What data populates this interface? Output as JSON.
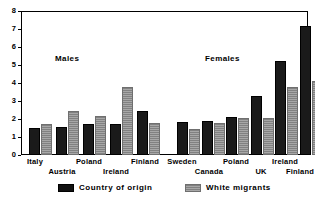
{
  "chart_data": {
    "type": "bar",
    "title": "",
    "subtitle": "",
    "xlabel": "",
    "ylabel": "",
    "ylim": [
      0,
      8
    ],
    "yticks": [
      0,
      1,
      2,
      3,
      4,
      5,
      6,
      7,
      8
    ],
    "ytick_labels": [
      "0",
      "1",
      "2",
      "3",
      "4",
      "5",
      "6",
      "7",
      "8"
    ],
    "grid": false,
    "legend_position": "bottom",
    "legend": [
      "Country of origin",
      "White migrants"
    ],
    "series": [
      {
        "name": "Country of origin",
        "color": "#111111",
        "values": [
          1.5,
          1.55,
          1.7,
          1.75,
          2.45,
          1.85,
          1.9,
          2.1,
          3.3,
          5.2,
          7.15
        ]
      },
      {
        "name": "White migrants",
        "color": "#9d9d9d",
        "values": [
          1.75,
          2.45,
          2.15,
          3.8,
          1.8,
          1.45,
          1.8,
          2.05,
          2.05,
          3.8,
          4.1
        ]
      }
    ],
    "categories": [
      "Italy",
      "Austria",
      "Poland",
      "Ireland",
      "Finland",
      "Sweden",
      "Canada",
      "Poland",
      "UK",
      "Ireland",
      "Finland"
    ],
    "panels": [
      {
        "label": "Males",
        "categories": [
          "Italy",
          "Austria",
          "Poland",
          "Ireland",
          "Finland"
        ]
      },
      {
        "label": "Females",
        "categories": [
          "Sweden",
          "Canada",
          "Poland",
          "UK",
          "Ireland",
          "Finland"
        ]
      }
    ],
    "annotations": [
      {
        "text": "Males",
        "x": 55,
        "y": 60
      },
      {
        "text": "Females",
        "x": 207,
        "y": 60
      }
    ]
  },
  "axis": {
    "y_labels": [
      "8",
      "7",
      "6",
      "5",
      "4",
      "3",
      "2",
      "1",
      "0"
    ]
  },
  "panel_labels": {
    "males": "Males",
    "females": "Females"
  },
  "x_axis_labels": [
    {
      "text": "Italy",
      "x": 35,
      "row": "top"
    },
    {
      "text": "Austria",
      "x": 62,
      "row": "bottom"
    },
    {
      "text": "Poland",
      "x": 89,
      "row": "top"
    },
    {
      "text": "Ireland",
      "x": 116,
      "row": "bottom"
    },
    {
      "text": "Finland",
      "x": 145,
      "row": "top"
    },
    {
      "text": "Sweden",
      "x": 182,
      "row": "top"
    },
    {
      "text": "Canada",
      "x": 209,
      "row": "bottom"
    },
    {
      "text": "Poland",
      "x": 236,
      "row": "top"
    },
    {
      "text": "UK",
      "x": 261,
      "row": "bottom"
    },
    {
      "text": "Ireland",
      "x": 285,
      "row": "top"
    },
    {
      "text": "Finland",
      "x": 300,
      "row": "bottom"
    }
  ],
  "legend": {
    "items": [
      {
        "label": "Country of origin",
        "swatch": "origin",
        "x": 58
      },
      {
        "label": "White migrants",
        "swatch": "migrant",
        "x": 185
      }
    ]
  }
}
